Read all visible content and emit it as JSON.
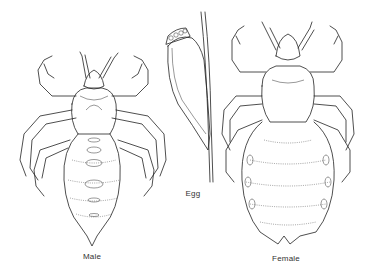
{
  "figure": {
    "panels": [
      {
        "id": "male",
        "label": "Male",
        "label_x": 92,
        "label_y": 256
      },
      {
        "id": "egg",
        "label": "Egg",
        "label_x": 193,
        "label_y": 193
      },
      {
        "id": "female",
        "label": "Female",
        "label_x": 286,
        "label_y": 258
      }
    ]
  },
  "colors": {
    "background": "#ffffff",
    "line": "#222222",
    "label": "#333333"
  }
}
